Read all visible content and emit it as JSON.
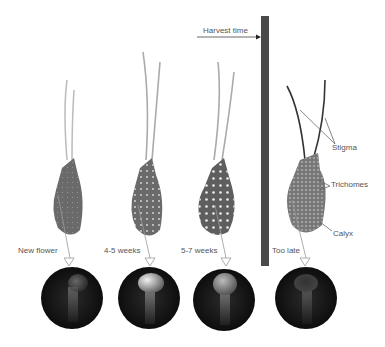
{
  "diagram": {
    "harvest_label": "Harvest time",
    "stages": [
      {
        "label": "New flower"
      },
      {
        "label": "4-5 weeks"
      },
      {
        "label": "5-7 weeks"
      },
      {
        "label": "Too late"
      }
    ],
    "annotations": {
      "stigma": "Stigma",
      "trichomes": "Trichomes",
      "calyx": "Calyx"
    },
    "colors": {
      "bar": "#4a4a4a",
      "calyx": "#6a6a6a",
      "circle": "#1a1a1a",
      "text": "#555555"
    }
  }
}
